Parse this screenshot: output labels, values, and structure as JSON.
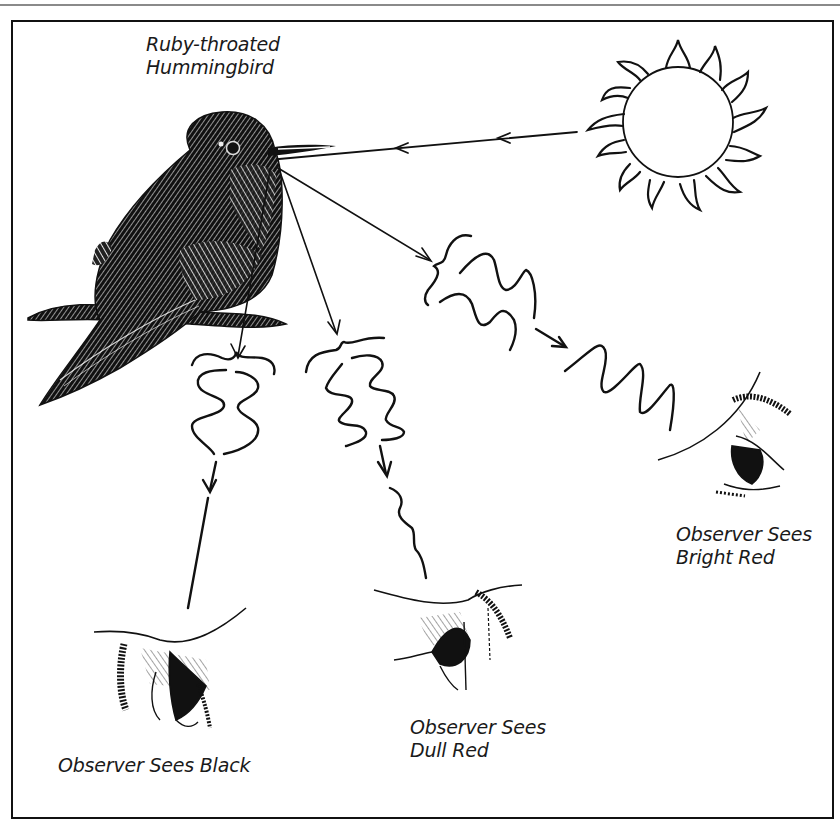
{
  "diagram": {
    "title_lines": [
      "Ruby-throated",
      "Hummingbird"
    ],
    "labels": {
      "bright": [
        "Observer Sees",
        "Bright Red"
      ],
      "dull": [
        "Observer Sees",
        "Dull Red"
      ],
      "black": [
        "Observer Sees Black"
      ]
    },
    "icons": {
      "sun": "sun-icon",
      "bird": "hummingbird-illustration",
      "eye": "observer-eye-icon",
      "wave": "light-wave-icon",
      "arrow": "arrow-icon"
    },
    "colors": {
      "ink": "#111111",
      "frame": "#111111",
      "background": "#ffffff",
      "top_rule": "#8a8a8a"
    }
  }
}
